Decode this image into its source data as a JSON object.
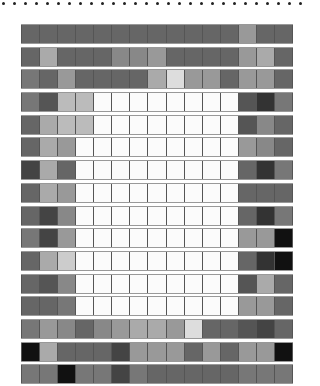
{
  "dots": {
    "count": 28,
    "start_x": 2,
    "spacing": 11,
    "color": "#222222"
  },
  "grid": {
    "columns": 15,
    "rows": [
      [
        "#666666",
        "#666666",
        "#666666",
        "#666666",
        "#666666",
        "#666666",
        "#666666",
        "#666666",
        "#666666",
        "#666666",
        "#666666",
        "#666666",
        "#999999",
        "#666666",
        "#666666"
      ],
      [
        "#666666",
        "#aaaaaa",
        "#666666",
        "#666666",
        "#666666",
        "#888888",
        "#888888",
        "#999999",
        "#666666",
        "#666666",
        "#666666",
        "#666666",
        "#999999",
        "#aaaaaa",
        "#666666"
      ],
      [
        "#777777",
        "#666666",
        "#999999",
        "#666666",
        "#666666",
        "#666666",
        "#666666",
        "#aaaaaa",
        "#dddddd",
        "#999999",
        "#999999",
        "#666666",
        "#999999",
        "#999999",
        "#666666"
      ],
      [
        "#777777",
        "#555555",
        "#bbbbbb",
        "#bbbbbb",
        "#fbfbfb",
        "#fbfbfb",
        "#fbfbfb",
        "#fbfbfb",
        "#fbfbfb",
        "#fbfbfb",
        "#fbfbfb",
        "#fbfbfb",
        "#555555",
        "#333333",
        "#777777"
      ],
      [
        "#666666",
        "#aaaaaa",
        "#bbbbbb",
        "#bbbbbb",
        "#fbfbfb",
        "#fbfbfb",
        "#fbfbfb",
        "#fbfbfb",
        "#fbfbfb",
        "#fbfbfb",
        "#fbfbfb",
        "#fbfbfb",
        "#555555",
        "#888888",
        "#666666"
      ],
      [
        "#666666",
        "#aaaaaa",
        "#999999",
        "#fbfbfb",
        "#fbfbfb",
        "#fbfbfb",
        "#fbfbfb",
        "#fbfbfb",
        "#fbfbfb",
        "#fbfbfb",
        "#fbfbfb",
        "#fbfbfb",
        "#999999",
        "#888888",
        "#666666"
      ],
      [
        "#444444",
        "#aaaaaa",
        "#666666",
        "#fbfbfb",
        "#fbfbfb",
        "#fbfbfb",
        "#fbfbfb",
        "#fbfbfb",
        "#fbfbfb",
        "#fbfbfb",
        "#fbfbfb",
        "#fbfbfb",
        "#666666",
        "#333333",
        "#777777"
      ],
      [
        "#666666",
        "#aaaaaa",
        "#999999",
        "#fbfbfb",
        "#fbfbfb",
        "#fbfbfb",
        "#fbfbfb",
        "#fbfbfb",
        "#fbfbfb",
        "#fbfbfb",
        "#fbfbfb",
        "#fbfbfb",
        "#666666",
        "#666666",
        "#666666"
      ],
      [
        "#666666",
        "#444444",
        "#888888",
        "#fbfbfb",
        "#fbfbfb",
        "#fbfbfb",
        "#fbfbfb",
        "#fbfbfb",
        "#fbfbfb",
        "#fbfbfb",
        "#fbfbfb",
        "#fbfbfb",
        "#666666",
        "#333333",
        "#777777"
      ],
      [
        "#777777",
        "#444444",
        "#999999",
        "#fbfbfb",
        "#fbfbfb",
        "#fbfbfb",
        "#fbfbfb",
        "#fbfbfb",
        "#fbfbfb",
        "#fbfbfb",
        "#fbfbfb",
        "#fbfbfb",
        "#999999",
        "#999999",
        "#111111"
      ],
      [
        "#666666",
        "#aaaaaa",
        "#cccccc",
        "#fbfbfb",
        "#fbfbfb",
        "#fbfbfb",
        "#fbfbfb",
        "#fbfbfb",
        "#fbfbfb",
        "#fbfbfb",
        "#fbfbfb",
        "#fbfbfb",
        "#666666",
        "#333333",
        "#111111"
      ],
      [
        "#666666",
        "#555555",
        "#888888",
        "#fbfbfb",
        "#fbfbfb",
        "#fbfbfb",
        "#fbfbfb",
        "#fbfbfb",
        "#fbfbfb",
        "#fbfbfb",
        "#fbfbfb",
        "#fbfbfb",
        "#555555",
        "#aaaaaa",
        "#666666"
      ],
      [
        "#666666",
        "#666666",
        "#777777",
        "#fbfbfb",
        "#fbfbfb",
        "#fbfbfb",
        "#fbfbfb",
        "#fbfbfb",
        "#fbfbfb",
        "#fbfbfb",
        "#fbfbfb",
        "#fbfbfb",
        "#999999",
        "#999999",
        "#666666"
      ],
      [
        "#777777",
        "#999999",
        "#888888",
        "#666666",
        "#888888",
        "#999999",
        "#aaaaaa",
        "#aaaaaa",
        "#999999",
        "#dddddd",
        "#666666",
        "#666666",
        "#555555",
        "#444444",
        "#666666"
      ],
      [
        "#111111",
        "#aaaaaa",
        "#666666",
        "#666666",
        "#666666",
        "#444444",
        "#999999",
        "#999999",
        "#999999",
        "#666666",
        "#999999",
        "#666666",
        "#999999",
        "#999999",
        "#111111"
      ],
      [
        "#777777",
        "#777777",
        "#111111",
        "#777777",
        "#777777",
        "#444444",
        "#777777",
        "#666666",
        "#666666",
        "#666666",
        "#666666",
        "#666666",
        "#777777",
        "#777777",
        "#777777"
      ]
    ]
  }
}
